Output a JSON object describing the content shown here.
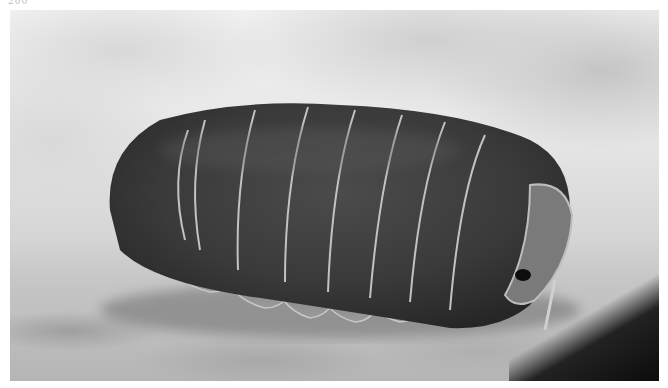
{
  "page": {
    "page_number": "200"
  },
  "photo": {
    "subject": "isopod (pill bug) on rock",
    "style": "black-and-white photograph",
    "colors": {
      "background_light": "#e6e6e6",
      "body_dark": "#3a3a3a",
      "segment_edge": "#bdbdbd",
      "shadow": "#0c0c0c"
    }
  }
}
